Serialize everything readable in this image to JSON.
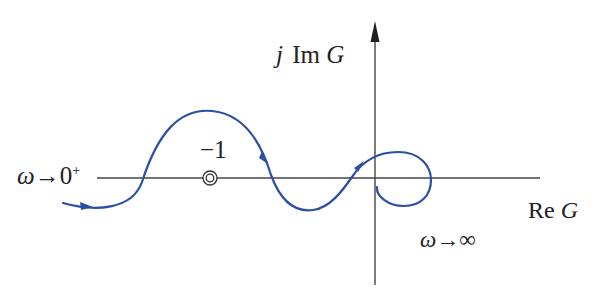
{
  "diagram": {
    "type": "nyquist_plot",
    "axes": {
      "imag_label_prefix": "j",
      "imag_label_mid": "Im",
      "imag_label_var": "G",
      "real_label_prefix": "Re",
      "real_label_var": "G"
    },
    "critical_point": {
      "label": "−1",
      "marker": "double-circle"
    },
    "annotations": {
      "start_omega": "ω",
      "start_arrow": "→",
      "start_value": "0",
      "start_sup": "+",
      "end_omega": "ω",
      "end_arrow": "→",
      "end_value": "∞"
    },
    "colors": {
      "curve": "#2b4fa3",
      "axes": "#333333",
      "text": "#222222"
    }
  }
}
